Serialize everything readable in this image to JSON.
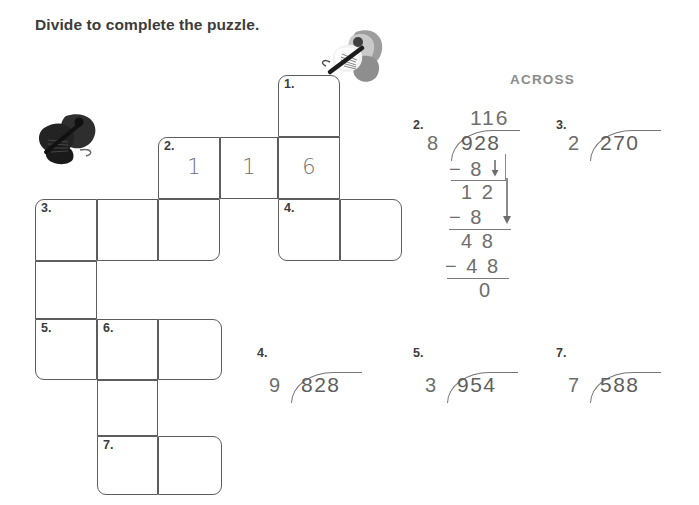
{
  "worksheet": {
    "title": "Divide to complete the puzzle.",
    "across_heading": "ACROSS"
  },
  "colors": {
    "text": "#3c3c3c",
    "grid_line": "#5d5d5d",
    "handwriting": "#6e6e6e",
    "heading_gray": "#8b8b8b",
    "butterfly_light": "#b9b9b9",
    "butterfly_dark": "#2b2b2b"
  },
  "crossword": {
    "cells": [
      {
        "id": "c1",
        "clue": "1.",
        "value": "",
        "x": 278,
        "y": 75,
        "w": 62,
        "h": 62,
        "corners": "rtl rtr"
      },
      {
        "id": "c2a",
        "clue": "2.",
        "value": "1",
        "x": 158,
        "y": 137,
        "w": 62,
        "h": 62,
        "corners": "rtl"
      },
      {
        "id": "c2b",
        "clue": "",
        "value": "1",
        "x": 220,
        "y": 137,
        "w": 58,
        "h": 62,
        "corners": ""
      },
      {
        "id": "c2c",
        "clue": "",
        "value": "6",
        "x": 278,
        "y": 137,
        "w": 62,
        "h": 62,
        "corners": ""
      },
      {
        "id": "c3a",
        "clue": "3.",
        "value": "",
        "x": 35,
        "y": 199,
        "w": 62,
        "h": 62,
        "corners": "rtl"
      },
      {
        "id": "c3b",
        "clue": "",
        "value": "",
        "x": 97,
        "y": 199,
        "w": 61,
        "h": 62,
        "corners": ""
      },
      {
        "id": "c3c",
        "clue": "",
        "value": "",
        "x": 158,
        "y": 199,
        "w": 62,
        "h": 62,
        "corners": "rbr"
      },
      {
        "id": "c4a",
        "clue": "4.",
        "value": "",
        "x": 278,
        "y": 199,
        "w": 62,
        "h": 62,
        "corners": "rbl"
      },
      {
        "id": "c4b",
        "clue": "",
        "value": "",
        "x": 340,
        "y": 199,
        "w": 62,
        "h": 62,
        "corners": "rtr rbr"
      },
      {
        "id": "c3d",
        "clue": "",
        "value": "",
        "x": 35,
        "y": 261,
        "w": 62,
        "h": 58,
        "corners": ""
      },
      {
        "id": "c5a",
        "clue": "5.",
        "value": "",
        "x": 35,
        "y": 319,
        "w": 62,
        "h": 61,
        "corners": "rbl"
      },
      {
        "id": "c6a",
        "clue": "6.",
        "value": "",
        "x": 97,
        "y": 319,
        "w": 61,
        "h": 61,
        "corners": ""
      },
      {
        "id": "c6b",
        "clue": "",
        "value": "",
        "x": 158,
        "y": 319,
        "w": 64,
        "h": 61,
        "corners": "rtr rbr"
      },
      {
        "id": "c6c",
        "clue": "",
        "value": "",
        "x": 97,
        "y": 380,
        "w": 61,
        "h": 56,
        "corners": ""
      },
      {
        "id": "c7a",
        "clue": "7.",
        "value": "",
        "x": 97,
        "y": 436,
        "w": 61,
        "h": 59,
        "corners": "rbl"
      },
      {
        "id": "c7b",
        "clue": "",
        "value": "",
        "x": 158,
        "y": 436,
        "w": 64,
        "h": 59,
        "corners": "rtr rbr"
      }
    ]
  },
  "butterflies": [
    {
      "name": "butterfly-light",
      "x": 312,
      "y": 26,
      "w": 72,
      "h": 62
    },
    {
      "name": "butterfly-dark",
      "x": 36,
      "y": 112,
      "w": 66,
      "h": 54
    }
  ],
  "problems": [
    {
      "number": "2.",
      "divisor": "8",
      "dividend": "928",
      "quotient": "116",
      "work": [
        {
          "text": "− 8",
          "has_arrow": true
        },
        {
          "text": "1 2",
          "has_arrow": false
        },
        {
          "text": "− 8",
          "has_arrow": true
        },
        {
          "text": "4 8",
          "has_arrow": false
        },
        {
          "text": "− 4 8",
          "has_arrow": false
        },
        {
          "text": "0",
          "has_arrow": false
        }
      ]
    },
    {
      "number": "3.",
      "divisor": "2",
      "dividend": "270",
      "quotient": "",
      "work": []
    },
    {
      "number": "4.",
      "divisor": "9",
      "dividend": "828",
      "quotient": "",
      "work": []
    },
    {
      "number": "5.",
      "divisor": "3",
      "dividend": "954",
      "quotient": "",
      "work": []
    },
    {
      "number": "7.",
      "divisor": "7",
      "dividend": "588",
      "quotient": "",
      "work": []
    }
  ]
}
